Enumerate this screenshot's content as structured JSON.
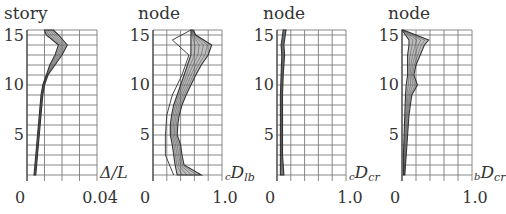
{
  "chart_data": [
    {
      "type": "line",
      "title": "story",
      "xlabel": "Δ/L",
      "ylabel": "story",
      "xlim": [
        0,
        0.04
      ],
      "ylim": [
        1,
        15.5
      ],
      "x_tick_labels": [
        "0",
        "0.04"
      ],
      "y_tick_labels": [
        "5",
        "10",
        "15"
      ],
      "x_grid_divisions": 4,
      "grid": true,
      "legend": null,
      "series_description": "bundle of ~20 overlapping response curves",
      "envelope": {
        "y": [
          1,
          3,
          5,
          7,
          9,
          10,
          11,
          12,
          13,
          14,
          15,
          15.5
        ],
        "x_min": [
          0.004,
          0.005,
          0.006,
          0.007,
          0.008,
          0.009,
          0.011,
          0.013,
          0.016,
          0.018,
          0.011,
          0.01
        ],
        "x_max": [
          0.005,
          0.006,
          0.007,
          0.008,
          0.009,
          0.01,
          0.012,
          0.016,
          0.02,
          0.023,
          0.018,
          0.015
        ]
      }
    },
    {
      "type": "line",
      "title": "node",
      "xlabel": "cDlb",
      "xlabel_prefix": "c",
      "xlabel_main": "D",
      "xlabel_sub": "lb",
      "ylabel": "node",
      "xlim": [
        0,
        1.0
      ],
      "ylim": [
        1,
        15.5
      ],
      "x_tick_labels": [
        "0",
        "1.0"
      ],
      "y_tick_labels": [
        "5",
        "10",
        "15"
      ],
      "x_grid_divisions": 5,
      "grid": true,
      "legend": null,
      "series_description": "bundle of ~20 overlapping response curves plus outlier curves",
      "envelope": {
        "y": [
          1,
          2,
          3,
          4,
          5,
          6,
          7,
          8,
          9,
          10,
          11,
          12,
          13,
          14,
          15,
          15.5
        ],
        "x_min": [
          0.35,
          0.32,
          0.3,
          0.28,
          0.25,
          0.25,
          0.27,
          0.3,
          0.35,
          0.4,
          0.45,
          0.5,
          0.55,
          0.55,
          0.55,
          0.55
        ],
        "x_max": [
          0.7,
          0.45,
          0.42,
          0.4,
          0.35,
          0.36,
          0.38,
          0.42,
          0.48,
          0.55,
          0.62,
          0.7,
          0.8,
          0.85,
          0.62,
          0.58
        ]
      },
      "outliers": [
        {
          "y": [
            1,
            3,
            5,
            7,
            9,
            11,
            13,
            14.5,
            15.5
          ],
          "x": [
            0.3,
            0.18,
            0.18,
            0.2,
            0.28,
            0.42,
            0.52,
            0.28,
            0.55
          ]
        }
      ]
    },
    {
      "type": "line",
      "title": "node",
      "xlabel": "cDcr",
      "xlabel_prefix": "c",
      "xlabel_main": "D",
      "xlabel_sub": "cr",
      "ylabel": "node",
      "xlim": [
        0,
        1.0
      ],
      "ylim": [
        1,
        15.5
      ],
      "x_tick_labels": [
        "0",
        "1.0"
      ],
      "y_tick_labels": [
        "5",
        "10",
        "15"
      ],
      "x_grid_divisions": 5,
      "grid": true,
      "legend": null,
      "series_description": "tightly clustered curves near zero",
      "envelope": {
        "y": [
          1,
          3,
          5,
          7,
          9,
          11,
          13,
          14,
          15,
          15.5
        ],
        "x_min": [
          0.05,
          0.05,
          0.05,
          0.05,
          0.05,
          0.06,
          0.07,
          0.06,
          0.08,
          0.09
        ],
        "x_max": [
          0.1,
          0.08,
          0.08,
          0.08,
          0.08,
          0.09,
          0.11,
          0.1,
          0.12,
          0.13
        ]
      }
    },
    {
      "type": "line",
      "title": "node",
      "xlabel": "bDcr",
      "xlabel_prefix": "b",
      "xlabel_main": "D",
      "xlabel_sub": "cr",
      "ylabel": "node",
      "xlim": [
        0,
        1.0
      ],
      "ylim": [
        1,
        15.5
      ],
      "x_tick_labels": [
        "0",
        "1.0"
      ],
      "y_tick_labels": [
        "5",
        "10",
        "15"
      ],
      "x_grid_divisions": 5,
      "grid": true,
      "legend": null,
      "series_description": "curves near zero with bulge around nodes 10-15",
      "envelope": {
        "y": [
          1,
          3,
          5,
          7,
          9,
          10,
          11,
          12,
          13,
          14,
          14.5,
          15,
          15.5
        ],
        "x_min": [
          0.02,
          0.02,
          0.03,
          0.04,
          0.05,
          0.06,
          0.08,
          0.08,
          0.08,
          0.1,
          0.1,
          0.05,
          0.0
        ],
        "x_max": [
          0.04,
          0.06,
          0.08,
          0.1,
          0.14,
          0.22,
          0.17,
          0.2,
          0.26,
          0.32,
          0.38,
          0.2,
          0.02
        ]
      }
    }
  ],
  "layout": {
    "panels": [
      {
        "left": 27,
        "right": 97,
        "top": 30,
        "bottom": 175
      },
      {
        "left": 153,
        "right": 222,
        "top": 30,
        "bottom": 175
      },
      {
        "left": 277,
        "right": 346,
        "top": 30,
        "bottom": 175
      },
      {
        "left": 402,
        "right": 472,
        "top": 30,
        "bottom": 175
      }
    ],
    "colors": {
      "grid": "#7a7a7a",
      "axis": "#555555",
      "curve": "#333333",
      "band": "#8a8a8a",
      "text": "#333333"
    }
  }
}
